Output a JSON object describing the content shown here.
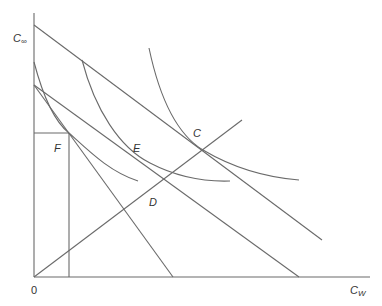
{
  "diagram": {
    "type": "economics-indifference-curve-diagram",
    "axes": {
      "y_label": "C",
      "y_label_subscript": "∞",
      "x_label": "C",
      "x_label_subscript": "W",
      "origin_label": "0"
    },
    "points": [
      {
        "label": "C",
        "x": 203,
        "y": 150
      },
      {
        "label": "D",
        "x": 165,
        "y": 178
      },
      {
        "label": "E",
        "x": 150,
        "y": 163
      },
      {
        "label": "F",
        "x": 69,
        "y": 133
      }
    ],
    "lines": [
      {
        "name": "budget-line-top",
        "from": [
          34,
          25
        ],
        "to": [
          322,
          240
        ]
      },
      {
        "name": "budget-line-middle",
        "from": [
          34,
          85
        ],
        "to": [
          299,
          277
        ]
      },
      {
        "name": "budget-line-steep",
        "from": [
          34,
          85
        ],
        "to": [
          173,
          277
        ]
      },
      {
        "name": "ray-from-origin",
        "from": [
          34,
          277
        ],
        "to": [
          242,
          120
        ]
      }
    ],
    "curves": [
      {
        "name": "indifference-curve-1"
      },
      {
        "name": "indifference-curve-2"
      },
      {
        "name": "indifference-curve-3"
      }
    ]
  }
}
